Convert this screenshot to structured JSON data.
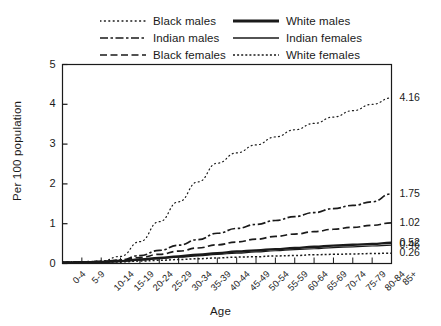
{
  "chart_data": {
    "type": "line",
    "title": "",
    "xlabel": "Age",
    "ylabel": "Per 100 population",
    "ylim": [
      0,
      5
    ],
    "yticks": [
      0,
      1,
      2,
      3,
      4,
      5
    ],
    "grid": false,
    "legend_position": "top",
    "categories": [
      "0-4",
      "5-9",
      "10-14",
      "15-19",
      "20-24",
      "25-29",
      "30-34",
      "35-39",
      "40-44",
      "45-49",
      "50-54",
      "55-59",
      "60-64",
      "65-69",
      "70-74",
      "75-79",
      "80-84",
      "85+"
    ],
    "series": [
      {
        "name": "Black males",
        "style": "dotted",
        "end_label": "4.16",
        "values": [
          0.04,
          0.05,
          0.06,
          0.18,
          0.55,
          1.05,
          1.55,
          2.05,
          2.52,
          2.78,
          2.98,
          3.18,
          3.36,
          3.52,
          3.68,
          3.84,
          4.0,
          4.16
        ]
      },
      {
        "name": "Indian males",
        "style": "dash-dot",
        "end_label": "1.75",
        "values": [
          0.03,
          0.04,
          0.05,
          0.09,
          0.2,
          0.33,
          0.46,
          0.6,
          0.76,
          0.88,
          0.98,
          1.08,
          1.18,
          1.28,
          1.38,
          1.46,
          1.55,
          1.75
        ]
      },
      {
        "name": "Black females",
        "style": "dashed",
        "end_label": "1.02",
        "values": [
          0.03,
          0.04,
          0.05,
          0.08,
          0.15,
          0.23,
          0.31,
          0.39,
          0.47,
          0.54,
          0.61,
          0.68,
          0.74,
          0.8,
          0.86,
          0.91,
          0.96,
          1.02
        ]
      },
      {
        "name": "White males",
        "style": "solid-thick",
        "end_label": "0.52",
        "values": [
          0.02,
          0.03,
          0.04,
          0.06,
          0.1,
          0.14,
          0.18,
          0.22,
          0.26,
          0.3,
          0.33,
          0.36,
          0.39,
          0.42,
          0.45,
          0.47,
          0.49,
          0.52
        ]
      },
      {
        "name": "Indian females",
        "style": "solid-thin",
        "end_label": "0.46",
        "values": [
          0.02,
          0.03,
          0.03,
          0.05,
          0.09,
          0.12,
          0.16,
          0.19,
          0.23,
          0.26,
          0.29,
          0.32,
          0.35,
          0.37,
          0.4,
          0.42,
          0.44,
          0.46
        ]
      },
      {
        "name": "White females",
        "style": "fine-dotted",
        "end_label": "0.26",
        "values": [
          0.02,
          0.02,
          0.03,
          0.04,
          0.06,
          0.08,
          0.1,
          0.12,
          0.14,
          0.16,
          0.17,
          0.19,
          0.2,
          0.22,
          0.23,
          0.24,
          0.25,
          0.26
        ]
      }
    ]
  },
  "legend": {
    "items": [
      {
        "label": "Black males",
        "style": "dotted"
      },
      {
        "label": "White males",
        "style": "solid-thick"
      },
      {
        "label": "Indian males",
        "style": "dash-dot"
      },
      {
        "label": "Indian females",
        "style": "solid-thin"
      },
      {
        "label": "Black females",
        "style": "dashed"
      },
      {
        "label": "White females",
        "style": "fine-dotted"
      }
    ]
  },
  "axes": {
    "y_title": "Per 100 population",
    "x_title": "Age",
    "y_tick_labels": [
      "5",
      "4",
      "3",
      "2",
      "1",
      "0"
    ],
    "x_tick_labels": [
      "0-4",
      "5-9",
      "10-14",
      "15-19",
      "20-24",
      "25-29",
      "30-34",
      "35-39",
      "40-44",
      "45-49",
      "50-54",
      "55-59",
      "60-64",
      "65-69",
      "70-74",
      "75-79",
      "80-84",
      "85+"
    ]
  },
  "end_labels": [
    "4.16",
    "1.75",
    "1.02",
    "0.52",
    "0.46",
    "0.26"
  ],
  "colors": {
    "ink": "#1a1a1a",
    "background": "#ffffff"
  }
}
